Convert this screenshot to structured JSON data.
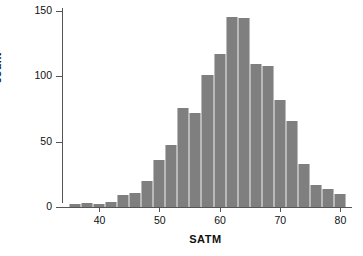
{
  "chart_data": {
    "type": "bar",
    "title": "",
    "subtitle": "",
    "xlabel": "SATM",
    "ylabel": "count",
    "xlim": [
      33.5,
      82
    ],
    "ylim": [
      0,
      152
    ],
    "grid": false,
    "legend": null,
    "bin_width": 2,
    "xticks": [
      40,
      50,
      60,
      70,
      80
    ],
    "xtick_labels": [
      "40",
      "50",
      "60",
      "70",
      "80"
    ],
    "yticks": [
      0,
      50,
      100,
      150
    ],
    "ytick_labels": [
      "0",
      "50",
      "100",
      "150"
    ],
    "bar_color": "#7f7f7f",
    "bar_edge_color": "#b9b9b9",
    "axis_color": "#555555",
    "categories": [
      36,
      38,
      40,
      42,
      44,
      46,
      48,
      50,
      52,
      54,
      56,
      58,
      60,
      62,
      64,
      66,
      68,
      70,
      72,
      74,
      76,
      78,
      80
    ],
    "bin_centers": [
      36,
      38,
      40,
      42,
      44,
      46,
      48,
      50,
      52,
      54,
      56,
      58,
      60,
      62,
      64,
      66,
      68,
      70,
      72,
      74,
      76,
      78,
      80
    ],
    "values": [
      2,
      3,
      2,
      4,
      9,
      11,
      20,
      36,
      47,
      76,
      72,
      101,
      117,
      145,
      144,
      109,
      108,
      82,
      66,
      33,
      17,
      14,
      10
    ]
  },
  "axes": {
    "ylabel": "count",
    "xlabel": "SATM"
  }
}
